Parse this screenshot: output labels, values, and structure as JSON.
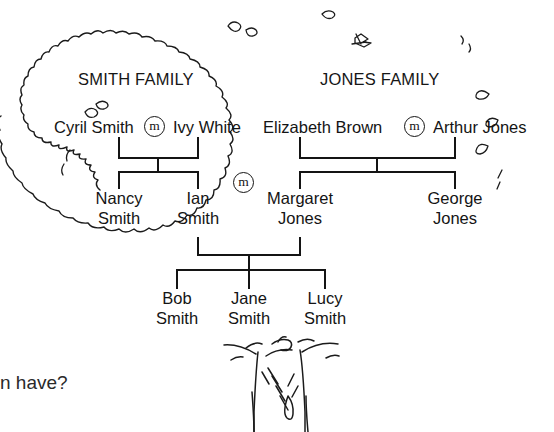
{
  "page": {
    "width": 554,
    "height": 432,
    "background": "#ffffff",
    "ink_color": "#141414"
  },
  "illustration": {
    "subject": "family-tree-on-tree-canopy",
    "canopy_label": "tree-canopy-outline",
    "trunk_label": "tree-trunk"
  },
  "headings": {
    "smith": "SMITH FAMILY",
    "jones": "JONES FAMILY"
  },
  "marriage_symbols": {
    "glyph": "m",
    "smith_couple": "m",
    "jones_couple": "m",
    "ian_margaret": "m"
  },
  "generation1": {
    "smith": {
      "spouse_left": "Cyril Smith",
      "spouse_right": "Ivy White"
    },
    "jones": {
      "spouse_left": "Elizabeth Brown",
      "spouse_right": "Arthur Jones"
    }
  },
  "generation2": {
    "nancy": {
      "first": "Nancy",
      "last": "Smith"
    },
    "ian": {
      "first": "Ian",
      "last": "Smith"
    },
    "margaret": {
      "first": "Margaret",
      "last": "Jones"
    },
    "george": {
      "first": "George",
      "last": "Jones"
    }
  },
  "generation3": {
    "bob": {
      "first": "Bob",
      "last": "Smith"
    },
    "jane": {
      "first": "Jane",
      "last": "Smith"
    },
    "lucy": {
      "first": "Lucy",
      "last": "Smith"
    }
  },
  "caption": {
    "visible_fragment": "n have?"
  }
}
